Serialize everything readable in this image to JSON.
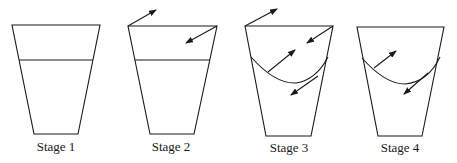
{
  "diagram": {
    "stages": [
      {
        "label": "Stage 1",
        "surface": "flat",
        "arrows": 0
      },
      {
        "label": "Stage 2",
        "surface": "flat",
        "arrows": 2
      },
      {
        "label": "Stage 3",
        "surface": "curved",
        "arrows": 4
      },
      {
        "label": "Stage 4",
        "surface": "curved",
        "arrows": 2
      }
    ],
    "colors": {
      "line": "#1a1a1a",
      "background": "#ffffff"
    }
  }
}
